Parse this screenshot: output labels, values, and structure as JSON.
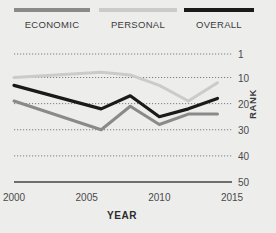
{
  "chart_data": {
    "type": "line",
    "title": "",
    "xlabel": "YEAR",
    "ylabel": "RANK",
    "x": [
      2000,
      2006,
      2008,
      2010,
      2012,
      2014
    ],
    "xlim": [
      2000,
      2015
    ],
    "xticks": [
      2000,
      2005,
      2010,
      2015
    ],
    "xtick_labels": [
      "2000",
      "2005",
      "2010",
      "2015"
    ],
    "ylim": [
      1,
      50
    ],
    "yticks": [
      1,
      10,
      20,
      30,
      40,
      50
    ],
    "ytick_labels": [
      "1",
      "10",
      "20",
      "30",
      "40",
      "50"
    ],
    "y_inverted": true,
    "grid": "horizontal-dotted",
    "legend_position": "top",
    "series": [
      {
        "name": "ECONOMIC",
        "color": "#8a8a8a",
        "values": [
          19,
          30,
          21,
          28,
          24,
          24
        ]
      },
      {
        "name": "PERSONAL",
        "color": "#cbcbcb",
        "values": [
          10,
          8,
          9,
          13,
          19,
          12
        ]
      },
      {
        "name": "OVERALL",
        "color": "#1a1a1a",
        "values": [
          13,
          22,
          17,
          25,
          22,
          18
        ]
      }
    ]
  },
  "legend": {
    "items": [
      {
        "label": "ECONOMIC"
      },
      {
        "label": "PERSONAL"
      },
      {
        "label": "OVERALL"
      }
    ]
  },
  "axes": {
    "x_title": "YEAR",
    "y_title": "RANK"
  },
  "colors": {
    "background": "#ededec",
    "economic": "#8a8a8a",
    "personal": "#cbcbcb",
    "overall": "#1a1a1a",
    "grid": "#7d7d7d",
    "axis": "#6e6e6e",
    "text": "#3b3b3b"
  }
}
